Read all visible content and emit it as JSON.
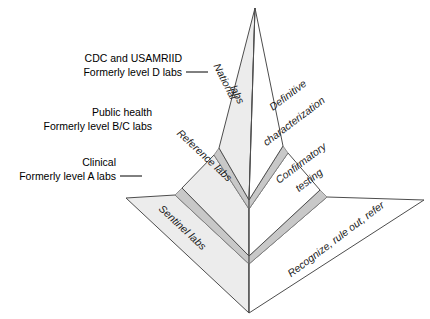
{
  "figure": {
    "colors": {
      "outline": "#4d4d4d",
      "left_face": "#ececec",
      "right_face": "#ffffff",
      "band": "#c8c8c8",
      "band_outline": "#808080",
      "text": "#000000",
      "background": "#ffffff"
    }
  },
  "callouts": [
    {
      "id": "national",
      "line1": "CDC and USAMRIID",
      "line2": "Formerly level D labs"
    },
    {
      "id": "reference",
      "line1": "Public health",
      "line2": "Formerly level B/C labs"
    },
    {
      "id": "sentinel",
      "line1": "Clinical",
      "line2": "Formerly level A labs"
    }
  ],
  "tiers": [
    {
      "id": "tier-national",
      "left_label_line1": "National",
      "left_label_line2": "labs",
      "right_label_line1": "Definitive",
      "right_label_line2": "characterization"
    },
    {
      "id": "tier-reference",
      "left_label_line1": "Reference labs",
      "left_label_line2": "",
      "right_label_line1": "Confirmatory",
      "right_label_line2": "testing"
    },
    {
      "id": "tier-sentinel",
      "left_label_line1": "Sentinel labs",
      "left_label_line2": "",
      "right_label_line1": "Recognize, rule out, refer",
      "right_label_line2": ""
    }
  ]
}
